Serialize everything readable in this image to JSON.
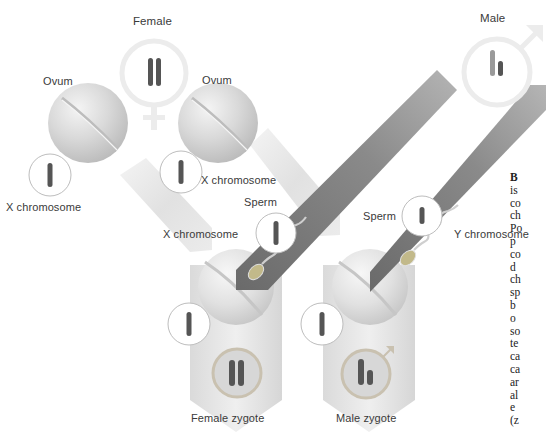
{
  "diagram": {
    "parents": {
      "female": {
        "label": "Female",
        "symbol": "♀",
        "chromosomes": "XX"
      },
      "male": {
        "label": "Male",
        "symbol": "♂",
        "chromosomes": "XY"
      }
    },
    "gametes": {
      "ovum_left": {
        "label": "Ovum",
        "chromosome_label": "X chromosome"
      },
      "ovum_right": {
        "label": "Ovum",
        "chromosome_label": "X chromosome"
      },
      "sperm_x": {
        "label": "Sperm",
        "chromosome_label": "X chromosome"
      },
      "sperm_y": {
        "label": "Sperm",
        "chromosome_label": "Y chromosome"
      }
    },
    "zygotes": {
      "female": {
        "label": "Female zygote",
        "chromosomes": "XX"
      },
      "male": {
        "label": "Male zygote",
        "chromosomes": "XY"
      }
    },
    "caption_fragments": [
      "B",
      "is",
      "co",
      "ch",
      "Po",
      "p",
      "co",
      "d",
      "ch",
      "sp",
      "b",
      "o",
      "so",
      "te",
      "ca",
      "ca",
      "ar",
      "al",
      "e",
      "(z"
    ],
    "colors": {
      "background": "#ffffff",
      "egg": "#d4d4d4",
      "pale_band": "#e2e2e2",
      "dark_band": "#7c7c7c",
      "chromosome": "#555555",
      "symbol_ring": "#ececec",
      "text": "#3a3a3a"
    }
  }
}
